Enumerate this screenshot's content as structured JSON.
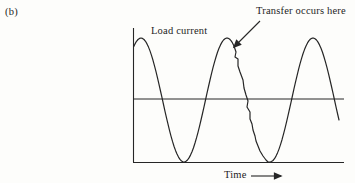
{
  "figure": {
    "panel_label": "(b)",
    "curve_label": "Load current",
    "annotation": "Transfer occurs here",
    "x_axis_label": "Time"
  },
  "colors": {
    "ink": "#262626",
    "background": "#fdfdfb"
  },
  "chart_data": {
    "type": "line",
    "title": "",
    "xlabel": "Time",
    "ylabel": "Load current",
    "x_tick_labels": [],
    "y_tick_labels": [],
    "grid": false,
    "annotations": [
      {
        "text": "Transfer occurs here",
        "points_to_xy": [
          234,
          47
        ]
      }
    ],
    "waveform": {
      "x_start": 133.5,
      "x_end": 339,
      "midline_y": 100,
      "amplitude": 62,
      "first_peak_x": 141,
      "period": 86,
      "jag_start_x": 233,
      "resume_x": 270,
      "transfer_jag_points": [
        [
          234,
          46
        ],
        [
          236,
          52
        ],
        [
          235,
          57
        ],
        [
          238,
          59
        ],
        [
          238,
          66
        ],
        [
          240,
          72
        ],
        [
          243,
          80
        ],
        [
          244,
          88
        ],
        [
          246,
          95
        ],
        [
          248,
          101
        ],
        [
          247,
          107
        ],
        [
          250,
          112
        ],
        [
          250,
          119
        ],
        [
          252,
          124
        ],
        [
          253,
          130
        ],
        [
          255,
          136
        ],
        [
          256,
          141
        ],
        [
          258,
          146
        ],
        [
          260,
          151
        ],
        [
          263,
          156
        ],
        [
          266,
          160
        ],
        [
          268,
          162
        ]
      ]
    },
    "axes": {
      "y_axis": {
        "x": 133.5,
        "y1": 28,
        "y2": 162.5
      },
      "x_axis": {
        "y": 162.5,
        "x1": 133,
        "x2": 344
      },
      "zero_line": {
        "y": 99,
        "x1": 133.5,
        "x2": 344
      }
    }
  }
}
